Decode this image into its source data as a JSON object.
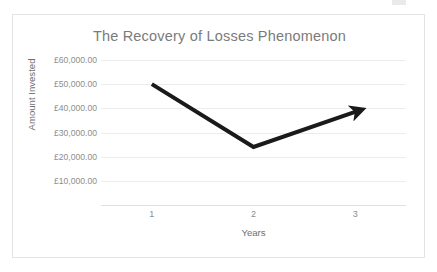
{
  "chart_data": {
    "type": "line",
    "title": "The Recovery of Losses Phenomenon",
    "xlabel": "Years",
    "ylabel": "Amount Invested",
    "categories": [
      "1",
      "2",
      "3"
    ],
    "x": [
      1,
      2,
      3
    ],
    "series": [
      {
        "name": "Amount Invested",
        "values": [
          50000,
          24000,
          38500
        ],
        "color": "#1a1a1a",
        "line_width": 4,
        "arrow_end": true
      }
    ],
    "ylim": [
      0,
      60000
    ],
    "xlim": [
      0.5,
      3.5
    ],
    "ytick_values": [
      60000,
      50000,
      40000,
      30000,
      20000,
      10000
    ],
    "ytick_labels": [
      "£60,000.00",
      "£50,000.00",
      "£40,000.00",
      "£30,000.00",
      "£20,000.00",
      "£10,000.00"
    ],
    "xtick_labels": [
      "1",
      "2",
      "3"
    ],
    "grid": true,
    "grid_axis": "y",
    "grid_color": "#ececec",
    "legend": false,
    "legend_position": "none",
    "currency_symbol": "£",
    "axis_text_color": "#8d8d8d",
    "title_color": "#7b7b7b",
    "border_color": "#e3e3e3",
    "background": "#ffffff"
  }
}
